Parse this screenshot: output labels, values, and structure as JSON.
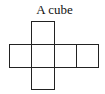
{
  "title": "A cube",
  "diagram": {
    "type": "cube-net",
    "line_color": "#222222",
    "squares": [
      {
        "name": "top",
        "x": 31,
        "y": 21,
        "w": 23,
        "h": 23
      },
      {
        "name": "left",
        "x": 9,
        "y": 44,
        "w": 22,
        "h": 23
      },
      {
        "name": "center",
        "x": 31,
        "y": 44,
        "w": 23,
        "h": 23
      },
      {
        "name": "right-1",
        "x": 54,
        "y": 44,
        "w": 22,
        "h": 23
      },
      {
        "name": "right-2",
        "x": 76,
        "y": 44,
        "w": 22,
        "h": 23
      },
      {
        "name": "bottom",
        "x": 31,
        "y": 67,
        "w": 23,
        "h": 22
      }
    ]
  }
}
